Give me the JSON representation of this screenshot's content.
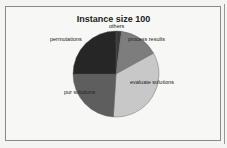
{
  "chart_data": {
    "type": "pie",
    "title": "Instance size 100",
    "categories": [
      "others",
      "process results",
      "evaluate solutions",
      "pur solutions",
      "permutations"
    ],
    "values": [
      2,
      15,
      34,
      24,
      25
    ],
    "colors": [
      "#3a3a3a",
      "#7d7d7d",
      "#c8c8c8",
      "#5e5e5e",
      "#262626"
    ],
    "legend": "none (inline labels)"
  },
  "labels": {
    "others": "others",
    "process_results": "process results",
    "evaluate_solutions": "evaluate solutions",
    "pur_solutions": "pur solutions",
    "permutations": "permutations"
  }
}
